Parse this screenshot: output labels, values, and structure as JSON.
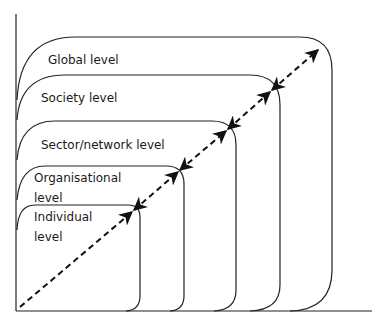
{
  "diagram": {
    "type": "nested-levels",
    "levels": [
      {
        "id": "global",
        "label_lines": [
          "Global level"
        ]
      },
      {
        "id": "society",
        "label_lines": [
          "Society level"
        ]
      },
      {
        "id": "sector",
        "label_lines": [
          "Sector/network level"
        ]
      },
      {
        "id": "organisational",
        "label_lines": [
          "Organisational",
          "level"
        ]
      },
      {
        "id": "individual",
        "label_lines": [
          "Individual",
          "level"
        ]
      }
    ],
    "arrow": {
      "style": "dashed",
      "direction": "bidirectional-at-boundaries"
    },
    "colors": {
      "stroke": "#222222",
      "background": "#ffffff"
    }
  }
}
